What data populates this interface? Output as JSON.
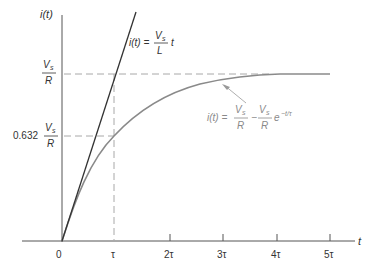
{
  "diagram": {
    "y_axis_label": "i(t)",
    "x_axis_label": "t",
    "x_ticks": [
      "0",
      "τ",
      "2τ",
      "3τ",
      "4τ",
      "5τ"
    ],
    "y_levels": {
      "final": {
        "num": "V",
        "num_sub": "s",
        "den": "R"
      },
      "at_tau": {
        "coef": "0.632",
        "num": "V",
        "num_sub": "s",
        "den": "R"
      }
    },
    "tangent_eq": {
      "lhs": "i(t) =",
      "num": "V",
      "num_sub": "s",
      "den": "L",
      "tail": "t"
    },
    "curve_eq": {
      "lhs": "i(t) =",
      "t1_num": "V",
      "t1_sub": "s",
      "t1_den": "R",
      "minus": "−",
      "t2_num": "V",
      "t2_sub": "s",
      "t2_den": "R",
      "exp_base": "e",
      "exp_pow": "−t/τ"
    },
    "colors": {
      "axis": "#555555",
      "tangent": "#333333",
      "curve": "#8a8a8a",
      "dashed": "#a8a8a8",
      "curve_label": "#8a8a8a"
    }
  }
}
